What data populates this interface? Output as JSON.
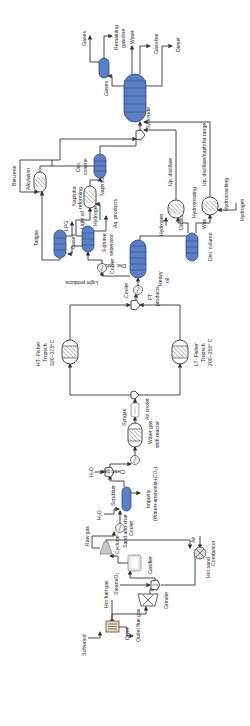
{
  "diagram": {
    "type": "process-flow-diagram",
    "orientation": "rotated -90deg",
    "colors": {
      "column_fill": "#5b7fc4",
      "column_stroke": "#2f4a86",
      "line": "#333333",
      "dryer_fill": "#e9dcc8",
      "background": "#ffffff"
    },
    "feed": {
      "softwood": "Softwood",
      "hot_fuel_gas": "Hot fuel gas",
      "dryer": "Dryer",
      "outlet_flue_gas": "Outlet flue gas",
      "grinder": "Grinder",
      "steam_o2": "Steam/O₂"
    },
    "gasification": {
      "gasifier": "Gasifier",
      "raw_gas": "Raw gas",
      "cyclone": "Cyclone",
      "sand_char": "Sand and char",
      "air": "Air",
      "combustor": "Combustor",
      "hot_sand": "Hot sand"
    },
    "cleanup": {
      "cooler": "Cooler",
      "h2o_1": "H₂O",
      "scrubber": "Scrubber",
      "impurity": "Impurity",
      "impurity_detail": "(Water+ammonia+CO₂)",
      "h2o_2": "H₂O",
      "clean_gas": "Clean gas",
      "wgs_reactor": "Water gas",
      "wgs_reactor_2": "shift reactor",
      "syngas": "Syngas",
      "air_cooler": "Air cooler"
    },
    "fischer_tropsch": {
      "ht_name": "HT- Fisher",
      "ht_name_2": "Tropsch",
      "ht_temp": "320~375°C",
      "lt_name": "LT- Fisher",
      "lt_name_2": "Tropsch",
      "lt_temp": "200~250° C",
      "ft_products": "FT",
      "ft_products_2": "products",
      "cooler": "Cooler"
    },
    "separation": {
      "dist_column": "Dist. column",
      "light_products": "Light products",
      "cooler": "Cooler",
      "heavy_oil": "Heavy",
      "heavy_oil_2": "oil",
      "three_phase": "3-phase",
      "three_phase_2": "seperator",
      "aq_products": "Aq. products",
      "light_oil": "Light oil",
      "hydrogen": "Hydrogen",
      "gases": "Gases",
      "lpg": "LPG",
      "dist_column_2": "Dist. column",
      "distillate": "Distillate",
      "wax": "Wax"
    },
    "upgrading": {
      "naphtha_reforming": "Naphtha",
      "naphtha_reforming_2": "reforming",
      "naphtha": "Naphtha",
      "tailgas": "Tailgas",
      "benzene": "Benzene",
      "alkylation": "Alkylation",
      "dist_column": "Dist.",
      "dist_column_2": "column",
      "hydrogen_ht": "Hydrogen",
      "hydrotreating": "Hydrotreating",
      "up_distillate": "Up. distillate",
      "hydrocracking": "Hydrocracking",
      "hydrogen_hc": "Hydrogen",
      "up_distillate_naphtha": "Up. distillate/naphtha range"
    },
    "products": {
      "syncrude": "Syncrude",
      "gases": "Gases",
      "remaining_gasoline": "Remaining",
      "remaining_gasoline_2": "gasoline",
      "water": "Water",
      "gasoline": "Gasoline",
      "diesel": "Diesel",
      "gases_top": "Gases"
    }
  }
}
